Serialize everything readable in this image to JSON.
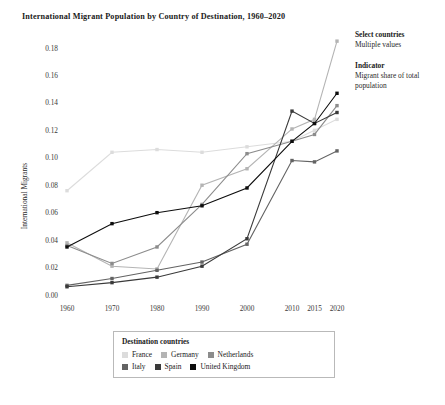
{
  "title": "International Migrant Population by Country of Destination, 1960–2020",
  "controls": [
    {
      "label": "Select countries",
      "value": "Multiple values"
    },
    {
      "label": "Indicator",
      "value": "Migrant share of total population"
    }
  ],
  "legend": {
    "title": "Destination countries",
    "rows": [
      [
        {
          "name": "France",
          "color": "#dcdcdc"
        },
        {
          "name": "Germany",
          "color": "#b4b4b4"
        },
        {
          "name": "Netherlands",
          "color": "#8c8c8c"
        }
      ],
      [
        {
          "name": "Italy",
          "color": "#636363"
        },
        {
          "name": "Spain",
          "color": "#3a3a3a"
        },
        {
          "name": "United Kingdom",
          "color": "#0d0d0d"
        }
      ]
    ]
  },
  "chart_data": {
    "type": "line",
    "title": "International Migrant Population by Country of Destination, 1960–2020",
    "xlabel": "",
    "ylabel": "International Migrants",
    "categories": [
      "1960",
      "1970",
      "1980",
      "1990",
      "2000",
      "2010",
      "2015",
      "2020"
    ],
    "ytick_labels": [
      "0.00",
      "0.02",
      "0.04",
      "0.06",
      "0.08",
      "0.10",
      "0.12",
      "0.14",
      "0.16",
      "0.18"
    ],
    "ytick_values": [
      0.0,
      0.02,
      0.04,
      0.06,
      0.08,
      0.1,
      0.12,
      0.14,
      0.16,
      0.18
    ],
    "ylim": [
      0.0,
      0.19
    ],
    "grid": false,
    "legend_position": "bottom",
    "markers": true,
    "series": [
      {
        "name": "France",
        "color": "#dcdcdc",
        "values": [
          0.076,
          0.104,
          0.106,
          0.104,
          0.108,
          0.112,
          0.12,
          0.128
        ]
      },
      {
        "name": "Germany",
        "color": "#b4b4b4",
        "values": [
          0.038,
          0.021,
          0.019,
          0.08,
          0.092,
          0.121,
          0.128,
          0.185
        ]
      },
      {
        "name": "Netherlands",
        "color": "#8c8c8c",
        "values": [
          0.036,
          0.023,
          0.035,
          0.066,
          0.103,
          0.112,
          0.117,
          0.138
        ]
      },
      {
        "name": "Italy",
        "color": "#636363",
        "values": [
          0.007,
          0.012,
          0.018,
          0.024,
          0.037,
          0.098,
          0.097,
          0.105
        ]
      },
      {
        "name": "Spain",
        "color": "#3a3a3a",
        "values": [
          0.006,
          0.009,
          0.013,
          0.021,
          0.041,
          0.134,
          0.125,
          0.133
        ]
      },
      {
        "name": "United Kingdom",
        "color": "#0d0d0d",
        "values": [
          0.035,
          0.052,
          0.06,
          0.065,
          0.078,
          0.112,
          0.125,
          0.147
        ]
      }
    ]
  }
}
